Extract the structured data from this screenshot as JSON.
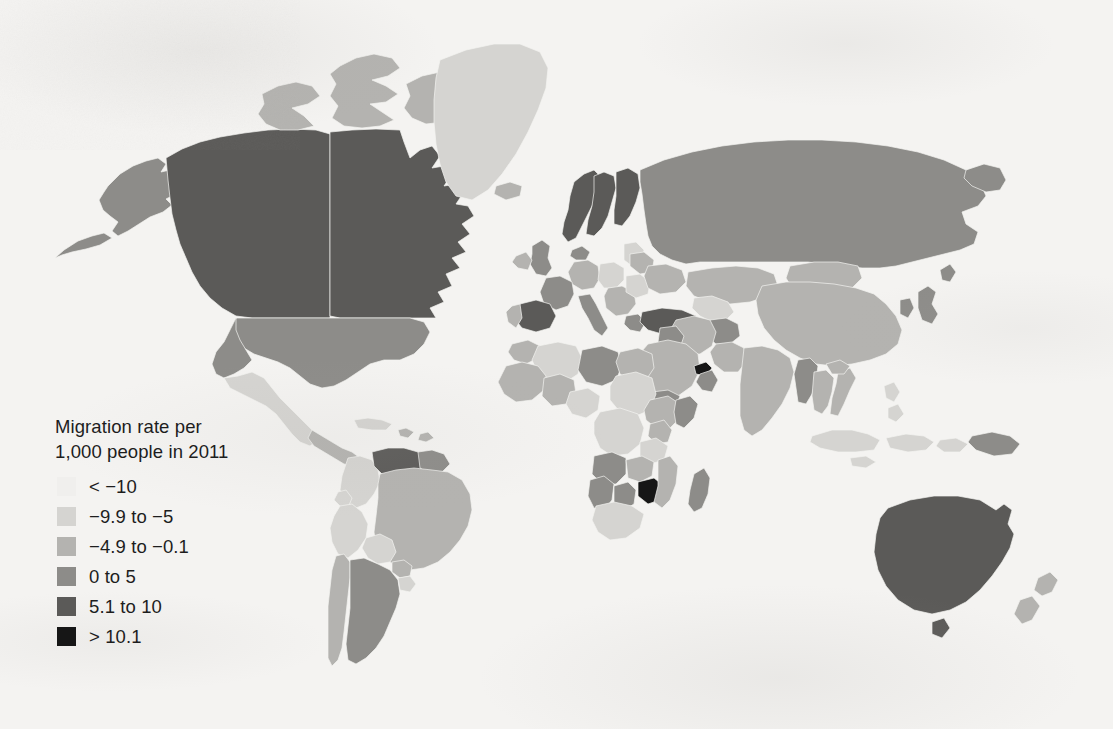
{
  "figure": {
    "kind": "choropleth-world-map",
    "background_color": "#f4f3f1",
    "projection": "robinson-like"
  },
  "legend": {
    "title": "Migration rate per\n1,000 people in 2011",
    "title_line1": "Migration rate per",
    "title_line2": "1,000 people in 2011",
    "classes": [
      {
        "label": "< −10",
        "color": "#f0efed",
        "min": null,
        "max": -10
      },
      {
        "label": "−9.9 to −5",
        "color": "#d5d4d1",
        "min": -9.9,
        "max": -5
      },
      {
        "label": "−4.9 to −0.1",
        "color": "#b4b3b0",
        "min": -4.9,
        "max": -0.1
      },
      {
        "label": "0 to 5",
        "color": "#8d8c89",
        "min": 0,
        "max": 5
      },
      {
        "label": "5.1 to 10",
        "color": "#5b5a58",
        "min": 5.1,
        "max": 10
      },
      {
        "label": "> 10.1",
        "color": "#161616",
        "min": 10.1,
        "max": null
      }
    ]
  },
  "chart_data": {
    "type": "map",
    "title": "Migration rate per 1,000 people in 2011",
    "value_unit": "net migrants per 1,000 people",
    "year": 2011,
    "legend_position": "lower-left",
    "class_colors": [
      "#f0efed",
      "#d5d4d1",
      "#b4b3b0",
      "#8d8c89",
      "#5b5a58",
      "#161616"
    ],
    "class_labels": [
      "< −10",
      "−9.9 to −5",
      "−4.9 to −0.1",
      "0 to 5",
      "5.1 to 10",
      "> 10.1"
    ],
    "regions": [
      {
        "name": "Canada",
        "class": 4
      },
      {
        "name": "United States",
        "class": 3
      },
      {
        "name": "Alaska",
        "class": 3
      },
      {
        "name": "Greenland",
        "class": 1
      },
      {
        "name": "Mexico",
        "class": 1
      },
      {
        "name": "Central America",
        "class": 2
      },
      {
        "name": "Cuba",
        "class": 1
      },
      {
        "name": "Caribbean",
        "class": 2
      },
      {
        "name": "Colombia",
        "class": 1
      },
      {
        "name": "Venezuela",
        "class": 4
      },
      {
        "name": "Guyana region",
        "class": 3
      },
      {
        "name": "Brazil",
        "class": 2
      },
      {
        "name": "Peru",
        "class": 1
      },
      {
        "name": "Bolivia",
        "class": 1
      },
      {
        "name": "Chile",
        "class": 2
      },
      {
        "name": "Argentina",
        "class": 3
      },
      {
        "name": "Paraguay",
        "class": 2
      },
      {
        "name": "Uruguay",
        "class": 1
      },
      {
        "name": "Ecuador",
        "class": 1
      },
      {
        "name": "United Kingdom",
        "class": 3
      },
      {
        "name": "Ireland",
        "class": 2
      },
      {
        "name": "Norway",
        "class": 4
      },
      {
        "name": "Sweden",
        "class": 4
      },
      {
        "name": "Finland",
        "class": 4
      },
      {
        "name": "Denmark",
        "class": 3
      },
      {
        "name": "Iceland",
        "class": 2
      },
      {
        "name": "Spain",
        "class": 4
      },
      {
        "name": "Portugal",
        "class": 2
      },
      {
        "name": "France",
        "class": 3
      },
      {
        "name": "Germany",
        "class": 2
      },
      {
        "name": "Italy",
        "class": 3
      },
      {
        "name": "Poland",
        "class": 1
      },
      {
        "name": "Baltic states",
        "class": 1
      },
      {
        "name": "Belarus",
        "class": 2
      },
      {
        "name": "Ukraine",
        "class": 2
      },
      {
        "name": "Romania",
        "class": 1
      },
      {
        "name": "Balkans",
        "class": 2
      },
      {
        "name": "Greece",
        "class": 3
      },
      {
        "name": "Turkey",
        "class": 4
      },
      {
        "name": "Russia",
        "class": 3
      },
      {
        "name": "Kazakhstan",
        "class": 2
      },
      {
        "name": "Central Asia",
        "class": 1
      },
      {
        "name": "Mongolia",
        "class": 2
      },
      {
        "name": "China",
        "class": 2
      },
      {
        "name": "Japan",
        "class": 3
      },
      {
        "name": "Korea",
        "class": 3
      },
      {
        "name": "India",
        "class": 2
      },
      {
        "name": "Pakistan",
        "class": 2
      },
      {
        "name": "Afghanistan",
        "class": 3
      },
      {
        "name": "Iran",
        "class": 2
      },
      {
        "name": "Iraq",
        "class": 3
      },
      {
        "name": "Saudi Arabia",
        "class": 2
      },
      {
        "name": "United Arab Emirates",
        "class": 5
      },
      {
        "name": "Oman",
        "class": 3
      },
      {
        "name": "Yemen",
        "class": 3
      },
      {
        "name": "Myanmar",
        "class": 3
      },
      {
        "name": "Thailand",
        "class": 2
      },
      {
        "name": "Vietnam",
        "class": 2
      },
      {
        "name": "Indonesia",
        "class": 1
      },
      {
        "name": "Philippines",
        "class": 1
      },
      {
        "name": "Papua New Guinea",
        "class": 3
      },
      {
        "name": "Australia",
        "class": 4
      },
      {
        "name": "New Zealand",
        "class": 2
      },
      {
        "name": "Morocco",
        "class": 2
      },
      {
        "name": "Algeria",
        "class": 1
      },
      {
        "name": "Libya",
        "class": 3
      },
      {
        "name": "Egypt",
        "class": 2
      },
      {
        "name": "Sudan",
        "class": 1
      },
      {
        "name": "Ethiopia",
        "class": 2
      },
      {
        "name": "Somalia",
        "class": 3
      },
      {
        "name": "Kenya",
        "class": 2
      },
      {
        "name": "Tanzania",
        "class": 1
      },
      {
        "name": "Nigeria",
        "class": 1
      },
      {
        "name": "West Africa",
        "class": 2
      },
      {
        "name": "DR Congo",
        "class": 1
      },
      {
        "name": "Angola",
        "class": 3
      },
      {
        "name": "Zambia",
        "class": 2
      },
      {
        "name": "Zimbabwe",
        "class": 5
      },
      {
        "name": "Namibia",
        "class": 3
      },
      {
        "name": "Botswana",
        "class": 3
      },
      {
        "name": "South Africa",
        "class": 1
      },
      {
        "name": "Mozambique",
        "class": 2
      },
      {
        "name": "Madagascar",
        "class": 3
      }
    ]
  }
}
